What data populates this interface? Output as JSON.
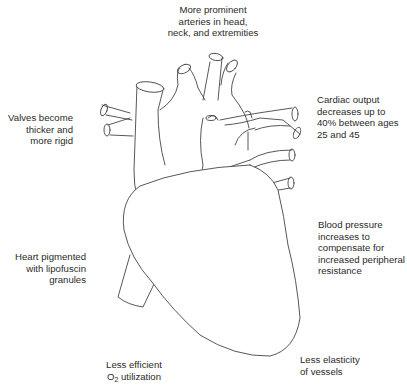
{
  "diagram": {
    "labels": {
      "top": [
        "More prominent",
        "arteries in head,",
        "neck, and extremities"
      ],
      "valves": [
        "Valves become",
        "thicker and",
        "more rigid"
      ],
      "cardiac_output": [
        "Cardiac output",
        "decreases up to",
        "40% between ages",
        "25 and 45"
      ],
      "blood_pressure": [
        "Blood pressure",
        "increases to",
        "compensate for",
        "increased peripheral",
        "resistance"
      ],
      "pigment": [
        "Heart pigmented",
        "with lipofuscin",
        "granules"
      ],
      "o2": {
        "line1": "Less efficient",
        "o_prefix": "O",
        "subscript": "2",
        "suffix": " utilization"
      },
      "elasticity": [
        "Less elasticity",
        "of vessels"
      ]
    }
  }
}
